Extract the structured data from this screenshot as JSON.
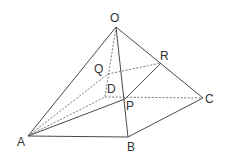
{
  "diagram": {
    "type": "pyramid",
    "line_color": "#4a4a4a",
    "dashed_color": "#6a6a6a",
    "points": {
      "O": {
        "label": "O",
        "x": 116,
        "y": 27,
        "lx": 110,
        "ly": 12
      },
      "A": {
        "label": "A",
        "x": 28,
        "y": 136,
        "lx": 17,
        "ly": 136
      },
      "B": {
        "label": "B",
        "x": 128,
        "y": 137,
        "lx": 127,
        "ly": 141
      },
      "C": {
        "label": "C",
        "x": 203,
        "y": 98,
        "lx": 205,
        "ly": 93
      },
      "D": {
        "label": "D",
        "x": 105,
        "y": 97,
        "lx": 107,
        "ly": 83
      },
      "P": {
        "label": "P",
        "x": 125,
        "y": 99,
        "lx": 126,
        "ly": 100
      },
      "Q": {
        "label": "Q",
        "x": 108,
        "y": 74,
        "lx": 94,
        "ly": 63
      },
      "R": {
        "label": "R",
        "x": 161,
        "y": 63,
        "lx": 160,
        "ly": 50
      }
    },
    "solid_edges": [
      [
        "O",
        "A"
      ],
      [
        "O",
        "B"
      ],
      [
        "O",
        "C"
      ],
      [
        "A",
        "B"
      ],
      [
        "B",
        "C"
      ],
      [
        "A",
        "P"
      ],
      [
        "P",
        "R"
      ]
    ],
    "dashed_edges": [
      [
        "O",
        "D"
      ],
      [
        "A",
        "D"
      ],
      [
        "D",
        "C"
      ],
      [
        "A",
        "Q"
      ],
      [
        "Q",
        "R"
      ]
    ]
  }
}
